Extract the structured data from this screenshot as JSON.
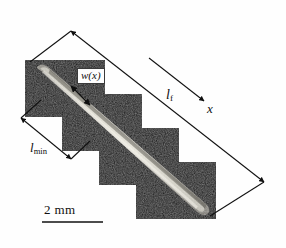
{
  "figure": {
    "type": "micrograph-with-dimension-annotations",
    "background_color": "#ffffff",
    "tile_color": "#0d0d0d",
    "specimen_color": "#b9b6ab",
    "annotation_color": "#101010"
  },
  "labels": {
    "length_full": {
      "symbol": "l",
      "subscript": "f",
      "name": "l_f"
    },
    "length_min": {
      "symbol": "l",
      "subscript": "min",
      "name": "l_min"
    },
    "width_function": {
      "text": "w(x)"
    },
    "axis": {
      "text": "x"
    },
    "scale_bar": {
      "text": "2 mm",
      "value": 2,
      "unit": "mm"
    }
  },
  "geometry": {
    "tiles": [
      {
        "x": 25,
        "y": 60,
        "w": 80,
        "h": 57
      },
      {
        "x": 62,
        "y": 94,
        "w": 80,
        "h": 57
      },
      {
        "x": 99,
        "y": 128,
        "w": 80,
        "h": 57
      },
      {
        "x": 136,
        "y": 162,
        "w": 80,
        "h": 57
      }
    ],
    "specimen": {
      "start": [
        38,
        68
      ],
      "end": [
        206,
        213
      ]
    },
    "scale_bar_line": {
      "x1": 42,
      "y1": 222,
      "x2": 103,
      "y2": 222
    },
    "lf_arrow": {
      "from": [
        70,
        30
      ],
      "to": [
        265,
        183
      ]
    },
    "lmin_arrow": {
      "from": [
        20,
        117
      ],
      "to": [
        72,
        160
      ]
    },
    "wx_arrow": {
      "from": [
        89,
        104
      ],
      "to": [
        70,
        85
      ]
    }
  }
}
